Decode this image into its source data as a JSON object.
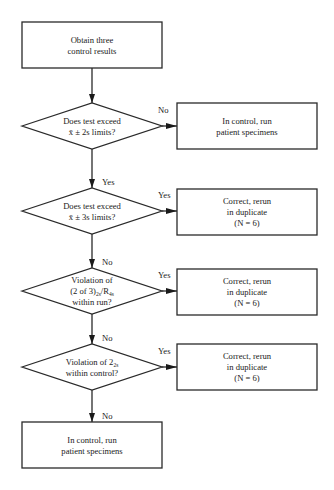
{
  "nodes": [
    {
      "id": "start",
      "type": "process",
      "name": "start-box",
      "lines": [
        "Obtain three",
        "control results"
      ]
    },
    {
      "id": "d1",
      "type": "decision",
      "name": "decision-2s-limits",
      "lines": [
        [
          {
            "t": "Does test exceed"
          }
        ],
        [
          {
            "t": "x̄ ± 2s limits?"
          }
        ]
      ]
    },
    {
      "id": "r1",
      "type": "process",
      "name": "in-control-box-1",
      "lines": [
        "In control, run",
        "patient specimens"
      ]
    },
    {
      "id": "d2",
      "type": "decision",
      "name": "decision-3s-limits",
      "lines": [
        [
          {
            "t": "Does test exceed"
          }
        ],
        [
          {
            "t": "x̄ ± 3s limits?"
          }
        ]
      ]
    },
    {
      "id": "r2",
      "type": "process",
      "name": "correct-rerun-box-1",
      "lines": [
        "Correct, rerun",
        "in duplicate",
        "(N = 6)"
      ]
    },
    {
      "id": "d3",
      "type": "decision",
      "name": "decision-2of3-r4s",
      "lines": [
        [
          {
            "t": "Violation of"
          }
        ],
        [
          {
            "t": "(2 of 3)"
          },
          {
            "t": "2s",
            "sub": true
          },
          {
            "t": "/R"
          },
          {
            "t": "4s",
            "sub": true
          }
        ],
        [
          {
            "t": "within run?"
          }
        ]
      ]
    },
    {
      "id": "r3",
      "type": "process",
      "name": "correct-rerun-box-2",
      "lines": [
        "Correct, rerun",
        "in duplicate",
        "(N = 6)"
      ]
    },
    {
      "id": "d4",
      "type": "decision",
      "name": "decision-22s-control",
      "lines": [
        [
          {
            "t": "Violation of 2"
          },
          {
            "t": "2s",
            "sub": true
          }
        ],
        [
          {
            "t": "within control?"
          }
        ]
      ]
    },
    {
      "id": "r4",
      "type": "process",
      "name": "correct-rerun-box-3",
      "lines": [
        "Correct, rerun",
        "in duplicate",
        "(N = 6)"
      ]
    },
    {
      "id": "end",
      "type": "process",
      "name": "in-control-box-2",
      "lines": [
        "In control, run",
        "patient specimens"
      ]
    }
  ],
  "edges": [
    {
      "from": "start",
      "to": "d1",
      "label": ""
    },
    {
      "from": "d1",
      "to": "r1",
      "label": "No"
    },
    {
      "from": "d1",
      "to": "d2",
      "label": "Yes"
    },
    {
      "from": "d2",
      "to": "r2",
      "label": "Yes"
    },
    {
      "from": "d2",
      "to": "d3",
      "label": "No"
    },
    {
      "from": "d3",
      "to": "r3",
      "label": "Yes"
    },
    {
      "from": "d3",
      "to": "d4",
      "label": "No"
    },
    {
      "from": "d4",
      "to": "r4",
      "label": "Yes"
    },
    {
      "from": "d4",
      "to": "end",
      "label": "No"
    }
  ]
}
